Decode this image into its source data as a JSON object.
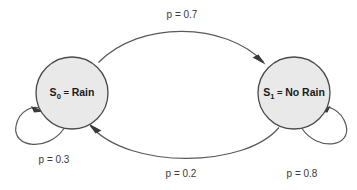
{
  "diagram": {
    "type": "markov-chain-state-diagram",
    "background_color": "#ffffff",
    "states": [
      {
        "id": "S0",
        "name": "S_0",
        "symbol": "S",
        "subscript": "0",
        "equals": " = ",
        "value": "Rain",
        "full_label": "S0 = Rain",
        "cx": 72,
        "cy": 93,
        "r": 36,
        "fill_color": "#e9e9e9",
        "stroke_color": "#4a4a4a"
      },
      {
        "id": "S1",
        "name": "S_1",
        "symbol": "S",
        "subscript": "1",
        "equals": " = ",
        "value": "No Rain",
        "full_label": "S1 = No Rain",
        "cx": 294,
        "cy": 93,
        "r": 36,
        "fill_color": "#e9e9e9",
        "stroke_color": "#4a4a4a"
      }
    ],
    "transitions": [
      {
        "id": "s0-to-s1",
        "from": "S0",
        "to": "S1",
        "probability": 0.7,
        "label": "p = 0.7",
        "label_x": 182,
        "label_y": 18,
        "shape": "top-arc"
      },
      {
        "id": "s1-to-s0",
        "from": "S1",
        "to": "S0",
        "probability": 0.2,
        "label": "p = 0.2",
        "label_x": 181,
        "label_y": 177,
        "shape": "bottom-arc"
      },
      {
        "id": "s0-to-s0",
        "from": "S0",
        "to": "S0",
        "probability": 0.3,
        "label": "p = 0.3",
        "label_x": 54,
        "label_y": 163,
        "shape": "self-loop-left"
      },
      {
        "id": "s1-to-s1",
        "from": "S1",
        "to": "S1",
        "probability": 0.8,
        "label": "p = 0.8",
        "label_x": 302,
        "label_y": 177,
        "shape": "self-loop-right"
      }
    ],
    "edge_color": "#5a5a5a",
    "arrow_color": "#3a3a3a",
    "text_color": "#3a3a3a"
  }
}
